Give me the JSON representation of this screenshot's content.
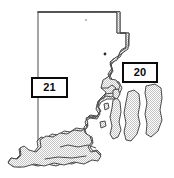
{
  "figure": {
    "kind": "map",
    "background_color": "#ffffff",
    "land_fill_color": "#c9c9c9",
    "land_fill_pattern": "stipple-halftone-dither",
    "outline_color": "#3a3a3a",
    "outline_width_px": 1
  },
  "callouts": [
    {
      "id": "callout-21",
      "label": "21",
      "border_color": "#0a0a0a",
      "fill_color": "#ffffff",
      "x": 31,
      "y": 77,
      "width": 37,
      "height": 21,
      "anchor_region": "western mainland"
    },
    {
      "id": "callout-20",
      "label": "20",
      "border_color": "#0a0a0a",
      "fill_color": "#ffffff",
      "x": 122,
      "y": 62,
      "width": 36,
      "height": 21,
      "anchor_region": "Narragansett Bay / east bay"
    }
  ],
  "markers": [
    {
      "id": "point-marker",
      "x": 105,
      "y": 54,
      "color": "#2b2b2b",
      "radius": 1.4
    },
    {
      "id": "point-marker-north",
      "x": 86,
      "y": 20,
      "color": "#6a6a6a",
      "radius": 0.8
    }
  ]
}
